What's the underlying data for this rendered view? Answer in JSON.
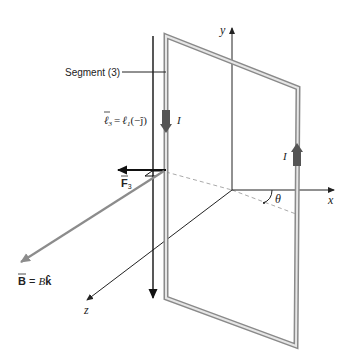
{
  "figure": {
    "segment_label": "Segment (3)",
    "current_label": "I",
    "length_vector": {
      "lhs": "ℓ",
      "lhs_sub": "3",
      "eq": "=",
      "rhs": "ℓ",
      "rhs_sub": "1",
      "rhs_vec": "(−ĵ)"
    },
    "force_label": "F",
    "force_sub": "3",
    "field_label": {
      "vec": "B",
      "eq": "= ",
      "mag": "B",
      "unit": "k̂"
    },
    "axes": {
      "x": "x",
      "y": "y",
      "z": "z"
    },
    "angle_label": "θ"
  },
  "colors": {
    "wire_outer": "#8a8a8a",
    "wire_inner": "#e6e6e6",
    "current_arrow": "#555555",
    "field_arrow": "#8c8c8c",
    "axis": "#222222"
  }
}
